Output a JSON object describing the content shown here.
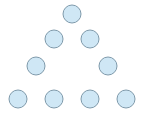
{
  "figure": {
    "title": "",
    "width": 144,
    "height": 118,
    "background_color": "#ffffff"
  },
  "chart_data": {
    "type": "scatter",
    "title": "",
    "subtitle": "",
    "xlabel": "",
    "ylabel": "",
    "xlim": [
      0,
      144
    ],
    "ylim": [
      0,
      118
    ],
    "grid": false,
    "legend": null,
    "axes_visible": false,
    "tick_labels_x": [],
    "tick_labels_y": [],
    "annotations": [],
    "marker": {
      "shape": "circle",
      "radius": 9,
      "fill_color": "#cfe7f5",
      "stroke_color": "#7f9aab",
      "stroke_width": 1
    },
    "point_count": 9,
    "row_counts": [
      1,
      2,
      2,
      4
    ],
    "series": [
      {
        "name": "dots",
        "points": [
          {
            "id": "dot-r1-c1",
            "row": 1,
            "col": 1,
            "x": 72,
            "y": 14
          },
          {
            "id": "dot-r2-c1",
            "row": 2,
            "col": 1,
            "x": 54,
            "y": 39
          },
          {
            "id": "dot-r2-c2",
            "row": 2,
            "col": 2,
            "x": 90,
            "y": 39
          },
          {
            "id": "dot-r3-c1",
            "row": 3,
            "col": 1,
            "x": 36,
            "y": 66
          },
          {
            "id": "dot-r3-c2",
            "row": 3,
            "col": 2,
            "x": 108,
            "y": 66
          },
          {
            "id": "dot-r4-c1",
            "row": 4,
            "col": 1,
            "x": 18,
            "y": 99
          },
          {
            "id": "dot-r4-c2",
            "row": 4,
            "col": 2,
            "x": 54,
            "y": 99
          },
          {
            "id": "dot-r4-c3",
            "row": 4,
            "col": 3,
            "x": 90,
            "y": 99
          },
          {
            "id": "dot-r4-c4",
            "row": 4,
            "col": 4,
            "x": 126,
            "y": 99
          }
        ]
      }
    ]
  }
}
